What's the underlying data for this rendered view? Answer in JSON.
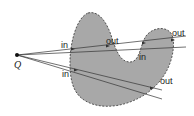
{
  "diagram": {
    "point": {
      "label": "Q",
      "x": 17,
      "y": 55
    },
    "shape": {
      "fill": "#a8a8a8",
      "stroke": "#333333",
      "stroke_style": "dashed"
    },
    "rays": [
      {
        "from": [
          17,
          55
        ],
        "to": [
          186,
          36
        ]
      },
      {
        "from": [
          17,
          55
        ],
        "to": [
          186,
          47
        ]
      },
      {
        "from": [
          17,
          55
        ],
        "to": [
          162,
          90
        ]
      },
      {
        "from": [
          17,
          55
        ],
        "to": [
          162,
          99
        ]
      }
    ],
    "labels": [
      {
        "text": "in",
        "x": 61,
        "y": 48
      },
      {
        "text": "out",
        "x": 106,
        "y": 44
      },
      {
        "text": "in",
        "x": 140,
        "y": 60
      },
      {
        "text": "out",
        "x": 172,
        "y": 36
      },
      {
        "text": "in",
        "x": 62,
        "y": 77
      },
      {
        "text": "out",
        "x": 160,
        "y": 84
      }
    ]
  }
}
